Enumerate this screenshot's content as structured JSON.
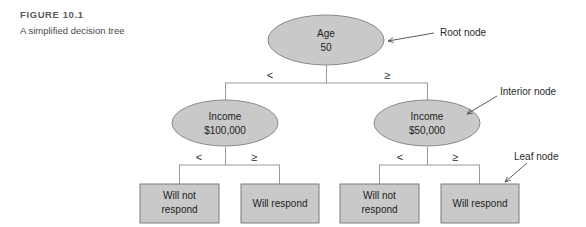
{
  "figure": {
    "number_label": "FIGURE 10.1",
    "caption": "A simplified decision tree"
  },
  "colors": {
    "node_fill": "#c9c9c9",
    "node_stroke": "#8a8a8a",
    "leaf_fill": "#c9c9c9",
    "leaf_stroke": "#7d7d7d",
    "connector": "#9a9a9a",
    "text": "#1d1d1d",
    "caption_title": "#5b5b5b",
    "background": "#ffffff"
  },
  "tree": {
    "root": {
      "line1": "Age",
      "line2": "50"
    },
    "interior_left": {
      "line1": "Income",
      "line2": "$100,000"
    },
    "interior_right": {
      "line1": "Income",
      "line2": "$50,000"
    },
    "branch_labels": {
      "root_left": "<",
      "root_right": "≥",
      "left_node_left": "<",
      "left_node_right": "≥",
      "right_node_left": "<",
      "right_node_right": "≥"
    },
    "leaves": [
      {
        "line1": "Will not",
        "line2": "respond"
      },
      {
        "line1": "Will respond",
        "line2": ""
      },
      {
        "line1": "Will not",
        "line2": "respond"
      },
      {
        "line1": "Will respond",
        "line2": ""
      }
    ]
  },
  "annotations": {
    "root_node": "Root node",
    "interior_node": "Interior node",
    "leaf_node": "Leaf node"
  }
}
